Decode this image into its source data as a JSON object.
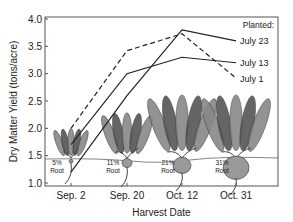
{
  "chart_data": {
    "type": "line",
    "title": "",
    "xlabel": "Harvest Date",
    "ylabel": "Dry Matter Yield (tons/acre)",
    "categories": [
      "Sep. 2",
      "Sep. 20",
      "Oct. 12",
      "Oct. 31"
    ],
    "ylim": [
      1.0,
      4.0
    ],
    "yticks": [
      "1.0",
      "1.5",
      "2.0",
      "2.5",
      "3.0",
      "3.5",
      "4.0"
    ],
    "grid": false,
    "legend_title": "Planted:",
    "legend_placement": "right, at line ends",
    "series": [
      {
        "name": "July 23",
        "style": "solid",
        "values": [
          1.2,
          2.6,
          3.8,
          3.6
        ]
      },
      {
        "name": "July 13",
        "style": "solid",
        "values": [
          1.7,
          3.0,
          3.3,
          3.2
        ]
      },
      {
        "name": "July 1",
        "style": "dashed",
        "values": [
          2.0,
          3.42,
          3.73,
          2.92
        ]
      }
    ],
    "annotations": [
      {
        "category": "Sep. 2",
        "text": [
          "5%",
          "Root"
        ]
      },
      {
        "category": "Sep. 20",
        "text": [
          "11%",
          "Root"
        ]
      },
      {
        "category": "Oct. 12",
        "text": [
          "21%",
          "Root"
        ]
      },
      {
        "category": "Oct. 31",
        "text": [
          "31%",
          "Root"
        ]
      }
    ],
    "illustration": "beet plants with roots at each harvest date, growing larger over time"
  }
}
